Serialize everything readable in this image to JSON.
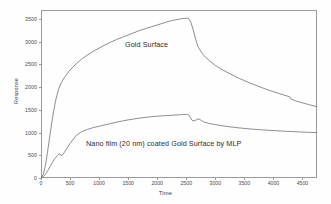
{
  "figure": {
    "background_color": "#fefefe",
    "frame_color": "#9a9a9a",
    "curve_color": "#5d5d5d"
  },
  "annotations": {
    "gold_surface": "Gold Surface",
    "nano_film": "Nano film (20 nm) coated Gold Surface by MLP"
  },
  "axes": {
    "xtitle": "Time",
    "ytitle": "Response",
    "xticks": [
      "0",
      "500",
      "1000",
      "1500",
      "2000",
      "2500",
      "3000",
      "3500",
      "4000",
      "4500"
    ],
    "yticks": [
      "0",
      "500",
      "1000",
      "1500",
      "2000",
      "2500",
      "3000",
      "3500"
    ]
  },
  "chart_data": {
    "type": "line",
    "title": "",
    "subtitle": "",
    "xlabel": "Time",
    "ylabel": "Response",
    "xlim": [
      0,
      4750
    ],
    "ylim": [
      0,
      3700
    ],
    "xticks": [
      0,
      500,
      1000,
      1500,
      2000,
      2500,
      3000,
      3500,
      4000,
      4500
    ],
    "yticks": [
      0,
      500,
      1000,
      1500,
      2000,
      2500,
      3000,
      3500
    ],
    "grid": false,
    "legend": "in-plot text annotations",
    "annotations": [
      {
        "text": "Gold Surface",
        "x": 1450,
        "y": 2980
      },
      {
        "text": "Nano film (20 nm) coated Gold Surface by MLP",
        "x": 1050,
        "y": 780
      }
    ],
    "series": [
      {
        "name": "Gold Surface",
        "x": [
          0,
          40,
          80,
          120,
          160,
          200,
          250,
          300,
          350,
          400,
          500,
          600,
          700,
          800,
          900,
          1000,
          1100,
          1200,
          1300,
          1400,
          1500,
          1600,
          1700,
          1800,
          1900,
          2000,
          2100,
          2200,
          2300,
          2400,
          2500,
          2540,
          2580,
          2620,
          2660,
          2700,
          2750,
          2800,
          2900,
          3000,
          3100,
          3200,
          3400,
          3600,
          3800,
          4000,
          4200,
          4280,
          4300,
          4400,
          4600,
          4750
        ],
        "y": [
          0,
          80,
          300,
          640,
          1000,
          1340,
          1700,
          1950,
          2100,
          2210,
          2380,
          2510,
          2620,
          2710,
          2790,
          2860,
          2930,
          2990,
          3050,
          3100,
          3150,
          3200,
          3250,
          3290,
          3330,
          3370,
          3410,
          3450,
          3480,
          3505,
          3520,
          3510,
          3430,
          3260,
          3060,
          2900,
          2790,
          2700,
          2580,
          2480,
          2400,
          2330,
          2200,
          2090,
          1990,
          1900,
          1820,
          1790,
          1740,
          1690,
          1620,
          1570
        ]
      },
      {
        "name": "Nano film (20 nm) coated Gold Surface by MLP",
        "x": [
          0,
          40,
          80,
          120,
          160,
          200,
          240,
          280,
          300,
          320,
          340,
          360,
          380,
          400,
          450,
          500,
          600,
          700,
          800,
          900,
          1000,
          1100,
          1200,
          1300,
          1400,
          1500,
          1600,
          1700,
          1800,
          1900,
          2000,
          2100,
          2200,
          2300,
          2400,
          2450,
          2500,
          2540,
          2570,
          2600,
          2620,
          2660,
          2700,
          2720,
          2760,
          2800,
          2900,
          3000,
          3200,
          3400,
          3600,
          3800,
          4000,
          4200,
          4400,
          4600,
          4750
        ],
        "y": [
          0,
          30,
          90,
          170,
          260,
          350,
          430,
          490,
          520,
          530,
          500,
          500,
          520,
          560,
          660,
          760,
          930,
          1020,
          1070,
          1110,
          1140,
          1170,
          1200,
          1230,
          1255,
          1280,
          1300,
          1320,
          1335,
          1350,
          1360,
          1370,
          1378,
          1385,
          1395,
          1400,
          1400,
          1390,
          1330,
          1270,
          1255,
          1270,
          1300,
          1300,
          1265,
          1235,
          1200,
          1175,
          1135,
          1105,
          1080,
          1060,
          1045,
          1030,
          1018,
          1006,
          1000
        ]
      }
    ]
  }
}
